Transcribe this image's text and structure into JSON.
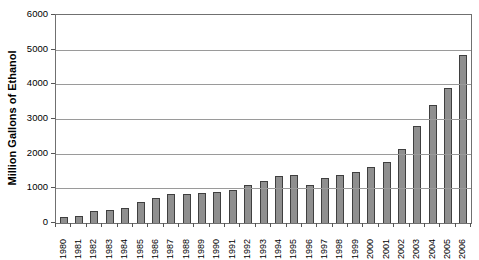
{
  "chart_data": {
    "type": "bar",
    "title": "",
    "xlabel": "",
    "ylabel": "Million Gallons of Ethanol",
    "categories": [
      "1980",
      "1981",
      "1982",
      "1983",
      "1984",
      "1985",
      "1986",
      "1987",
      "1988",
      "1989",
      "1990",
      "1991",
      "1992",
      "1993",
      "1994",
      "1995",
      "1996",
      "1997",
      "1998",
      "1999",
      "2000",
      "2001",
      "2002",
      "2003",
      "2004",
      "2005",
      "2006"
    ],
    "values": [
      175,
      215,
      350,
      375,
      430,
      610,
      710,
      830,
      845,
      870,
      900,
      950,
      1100,
      1200,
      1350,
      1400,
      1100,
      1300,
      1400,
      1470,
      1630,
      1770,
      2130,
      2800,
      3400,
      3904,
      4855
    ],
    "ylim": [
      0,
      6000
    ],
    "ytick_interval": 1000,
    "yticks": [
      "0",
      "1000",
      "2000",
      "3000",
      "4000",
      "5000",
      "6000"
    ],
    "grid": "horizontal-gridlines-over-bars",
    "legend": "none",
    "colors": {
      "bar_fill": "#8f8f8f",
      "bar_border": "#3f3f3f",
      "gridline": "#9a9a9a",
      "frame": "#707070",
      "tick": "#555555",
      "text": "#000000",
      "background": "#ffffff"
    }
  }
}
